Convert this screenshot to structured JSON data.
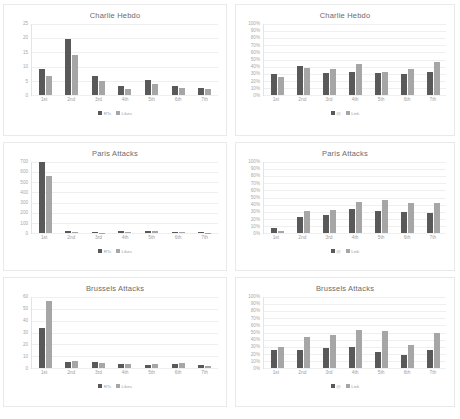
{
  "page": {
    "background": "#ffffff",
    "series_colors": {
      "primary": "#595959",
      "secondary": "#a6a6a6"
    }
  },
  "charts": [
    {
      "id": "charlie-hebdo-counts",
      "position": "top-left",
      "chart_data": {
        "type": "bar",
        "title": "Charlie Hebdo",
        "xlabel": "",
        "ylabel": "",
        "categories": [
          "1st",
          "2nd",
          "3rd",
          "4th",
          "5th",
          "6th",
          "7th"
        ],
        "series": [
          {
            "name": "RTs",
            "color": "#595959",
            "values": [
              9.2,
              19.8,
              6.8,
              3.2,
              5.2,
              3.0,
              2.6
            ]
          },
          {
            "name": "Likes",
            "color": "#a6a6a6",
            "values": [
              6.8,
              14.0,
              5.0,
              2.0,
              3.8,
              2.6,
              2.2
            ]
          }
        ],
        "ylim": [
          0,
          25
        ],
        "yticks": [
          0,
          5,
          10,
          15,
          20,
          25
        ],
        "ytick_labels": [
          "0",
          "5",
          "10",
          "15",
          "20",
          "25"
        ],
        "grid": true,
        "legend": "bottom"
      }
    },
    {
      "id": "charlie-hebdo-percent",
      "position": "top-right",
      "chart_data": {
        "type": "bar",
        "title": "Charlie Hebdo",
        "xlabel": "",
        "ylabel": "",
        "categories": [
          "1st",
          "2nd",
          "3rd",
          "4th",
          "5th",
          "6th",
          "7th"
        ],
        "series": [
          {
            "name": "@",
            "color": "#595959",
            "values": [
              29,
              41,
              31,
              33,
              31,
              30,
              32
            ]
          },
          {
            "name": "Link",
            "color": "#a6a6a6",
            "values": [
              25,
              38,
              36,
              43,
              32,
              37,
              46
            ]
          }
        ],
        "ylim": [
          0,
          100
        ],
        "yticks": [
          0,
          10,
          20,
          30,
          40,
          50,
          60,
          70,
          80,
          90,
          100
        ],
        "ytick_labels": [
          "0%",
          "10%",
          "20%",
          "30%",
          "40%",
          "50%",
          "60%",
          "70%",
          "80%",
          "90%",
          "100%"
        ],
        "grid": true,
        "legend": "bottom"
      }
    },
    {
      "id": "paris-attacks-counts",
      "position": "middle-left",
      "chart_data": {
        "type": "bar",
        "title": "Paris Attacks",
        "xlabel": "",
        "ylabel": "",
        "categories": [
          "1st",
          "2nd",
          "3rd",
          "4th",
          "5th",
          "6th",
          "7th"
        ],
        "series": [
          {
            "name": "RTs",
            "color": "#595959",
            "values": [
              700,
              18,
              6,
              16,
              20,
              12,
              6
            ]
          },
          {
            "name": "Likes",
            "color": "#a6a6a6",
            "values": [
              565,
              14,
              5,
              12,
              15,
              9,
              5
            ]
          }
        ],
        "ylim": [
          0,
          700
        ],
        "yticks": [
          0,
          100,
          200,
          300,
          400,
          500,
          600,
          700
        ],
        "ytick_labels": [
          "0",
          "100",
          "200",
          "300",
          "400",
          "500",
          "600",
          "700"
        ],
        "grid": true,
        "legend": "bottom"
      }
    },
    {
      "id": "paris-attacks-percent",
      "position": "middle-right",
      "chart_data": {
        "type": "bar",
        "title": "Paris Attacks",
        "xlabel": "",
        "ylabel": "",
        "categories": [
          "1st",
          "2nd",
          "3rd",
          "4th",
          "5th",
          "6th",
          "7th"
        ],
        "series": [
          {
            "name": "@",
            "color": "#595959",
            "values": [
              7,
              23,
              25,
              34,
              31,
              30,
              28
            ]
          },
          {
            "name": "Link",
            "color": "#a6a6a6",
            "values": [
              3,
              31,
              33,
              43,
              46,
              42,
              42
            ]
          }
        ],
        "ylim": [
          0,
          100
        ],
        "yticks": [
          0,
          10,
          20,
          30,
          40,
          50,
          60,
          70,
          80,
          90,
          100
        ],
        "ytick_labels": [
          "0%",
          "10%",
          "20%",
          "30%",
          "40%",
          "50%",
          "60%",
          "70%",
          "80%",
          "90%",
          "100%"
        ],
        "grid": true,
        "legend": "bottom"
      }
    },
    {
      "id": "brussels-attacks-counts",
      "position": "bottom-left",
      "chart_data": {
        "type": "bar",
        "title": "Brussels Attacks",
        "xlabel": "",
        "ylabel": "",
        "categories": [
          "1st",
          "2nd",
          "3rd",
          "4th",
          "5th",
          "6th",
          "7th"
        ],
        "series": [
          {
            "name": "RTs",
            "color": "#595959",
            "values": [
              34,
              5,
              5,
              3,
              2.5,
              3.5,
              2.5
            ]
          },
          {
            "name": "Likes",
            "color": "#a6a6a6",
            "values": [
              57,
              6,
              4,
              3.5,
              3,
              4,
              1.5
            ]
          }
        ],
        "ylim": [
          0,
          60
        ],
        "yticks": [
          0,
          10,
          20,
          30,
          40,
          50,
          60
        ],
        "ytick_labels": [
          "0",
          "10",
          "20",
          "30",
          "40",
          "50",
          "60"
        ],
        "grid": true,
        "legend": "bottom"
      }
    },
    {
      "id": "brussels-attacks-percent",
      "position": "bottom-right",
      "chart_data": {
        "type": "bar",
        "title": "Brussels Attacks",
        "xlabel": "",
        "ylabel": "",
        "categories": [
          "1st",
          "2nd",
          "3rd",
          "4th",
          "5th",
          "6th",
          "7th"
        ],
        "series": [
          {
            "name": "@",
            "color": "#595959",
            "values": [
              26,
              26,
              28,
              30,
              23,
              18,
              25
            ]
          },
          {
            "name": "Link",
            "color": "#a6a6a6",
            "values": [
              30,
              43,
              46,
              53,
              52,
              33,
              49
            ]
          }
        ],
        "ylim": [
          0,
          100
        ],
        "yticks": [
          0,
          10,
          20,
          30,
          40,
          50,
          60,
          70,
          80,
          90,
          100
        ],
        "ytick_labels": [
          "0%",
          "10%",
          "20%",
          "30%",
          "40%",
          "50%",
          "60%",
          "70%",
          "80%",
          "90%",
          "100%"
        ],
        "grid": true,
        "legend": "bottom"
      }
    }
  ]
}
